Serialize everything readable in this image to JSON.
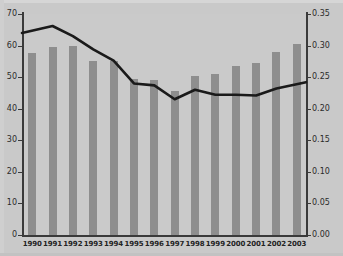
{
  "chart_data": {
    "type": "bar",
    "title": "",
    "subtitle": "",
    "xlabel": "",
    "ylabel": "",
    "grid": false,
    "legend": "none",
    "categories": [
      "1990",
      "1991",
      "1992",
      "1993",
      "1994",
      "1995",
      "1996",
      "1997",
      "1998",
      "1999",
      "2000",
      "2001",
      "2002",
      "2003"
    ],
    "series": [
      {
        "name": "bars",
        "type": "bar",
        "axis": "left",
        "color": "#8e8e8e",
        "values": [
          57.5,
          59.5,
          60.0,
          55.0,
          55.0,
          49.5,
          49.0,
          45.5,
          50.5,
          51.0,
          53.5,
          54.5,
          58.0,
          60.5
        ]
      },
      {
        "name": "line",
        "type": "line",
        "axis": "right",
        "color": "#1a1a1a",
        "values": [
          0.32,
          0.331,
          0.315,
          0.294,
          0.276,
          0.24,
          0.237,
          0.215,
          0.23,
          0.222,
          0.222,
          0.221,
          0.232,
          0.242
        ]
      }
    ],
    "left_axis": {
      "min": 0,
      "max": 70,
      "step": 10,
      "ticks": [
        "0",
        "10",
        "20",
        "30",
        "40",
        "50",
        "60",
        "70"
      ]
    },
    "right_axis": {
      "min": 0.0,
      "max": 0.35,
      "step": 0.05,
      "ticks": [
        "0.00",
        "0.05",
        "0.10",
        "0.15",
        "0.20",
        "0.25",
        "0.30",
        "0.35"
      ]
    },
    "colors": {
      "background": "#c9c9c9",
      "plot_background": "#cacaca",
      "bar": "#8e8e8e",
      "line": "#1a1a1a",
      "axis": "#3a3a3a",
      "text": "#2b2b2b"
    }
  }
}
